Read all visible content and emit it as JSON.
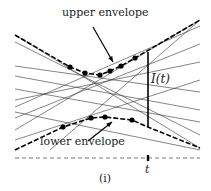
{
  "labels": {
    "upper": "upper envelope",
    "lower": "lower envelope",
    "interval": "I(t)",
    "t": "t",
    "caption": "(i)"
  },
  "colors": {
    "line": "#333333",
    "dot": "#000000"
  },
  "lines": [
    [
      [
        15,
        35
      ],
      [
        200,
        148
      ]
    ],
    [
      [
        15,
        42
      ],
      [
        200,
        135
      ]
    ],
    [
      [
        15,
        66
      ],
      [
        200,
        92
      ]
    ],
    [
      [
        15,
        100
      ],
      [
        200,
        62
      ]
    ],
    [
      [
        15,
        107
      ],
      [
        200,
        26
      ]
    ],
    [
      [
        15,
        118
      ],
      [
        200,
        44
      ]
    ],
    [
      [
        15,
        130
      ],
      [
        200,
        20
      ]
    ],
    [
      [
        15,
        89
      ],
      [
        200,
        122
      ]
    ],
    [
      [
        15,
        76
      ],
      [
        200,
        110
      ]
    ],
    [
      [
        15,
        140
      ],
      [
        200,
        80
      ]
    ],
    [
      [
        50,
        150
      ],
      [
        200,
        20
      ]
    ],
    [
      [
        15,
        112
      ],
      [
        200,
        150
      ]
    ]
  ],
  "upper_envelope": [
    [
      15,
      35
    ],
    [
      70,
      67
    ],
    [
      85,
      73
    ],
    [
      100,
      75
    ],
    [
      110,
      71
    ],
    [
      121,
      66
    ],
    [
      135,
      58
    ],
    [
      200,
      20
    ]
  ],
  "upper_dots": [
    [
      70,
      67
    ],
    [
      85,
      73
    ],
    [
      100,
      75
    ],
    [
      110,
      71
    ],
    [
      121,
      66
    ],
    [
      135,
      58
    ]
  ],
  "lower_envelope": [
    [
      15,
      150
    ],
    [
      63,
      127
    ],
    [
      91,
      118
    ],
    [
      105,
      117
    ],
    [
      132,
      120
    ],
    [
      148,
      127
    ],
    [
      200,
      148
    ]
  ],
  "lower_dots": [
    [
      63,
      127
    ],
    [
      91,
      118
    ],
    [
      105,
      117
    ],
    [
      132,
      120
    ]
  ],
  "vertical_segment": {
    "x": 148,
    "y1": 52,
    "y2": 127
  },
  "baseline_y": 158,
  "t_x": 148
}
